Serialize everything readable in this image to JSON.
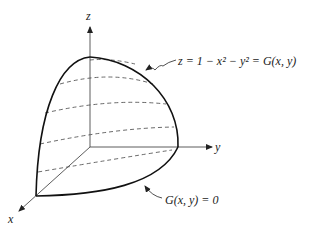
{
  "diagram": {
    "type": "3d-surface-octant",
    "axes": {
      "x_label": "x",
      "y_label": "y",
      "z_label": "z"
    },
    "surface_label": "z = 1 − x² − y² = G(x, y)",
    "boundary_label": "G(x, y) = 0",
    "dashed_level_curves": 6
  }
}
